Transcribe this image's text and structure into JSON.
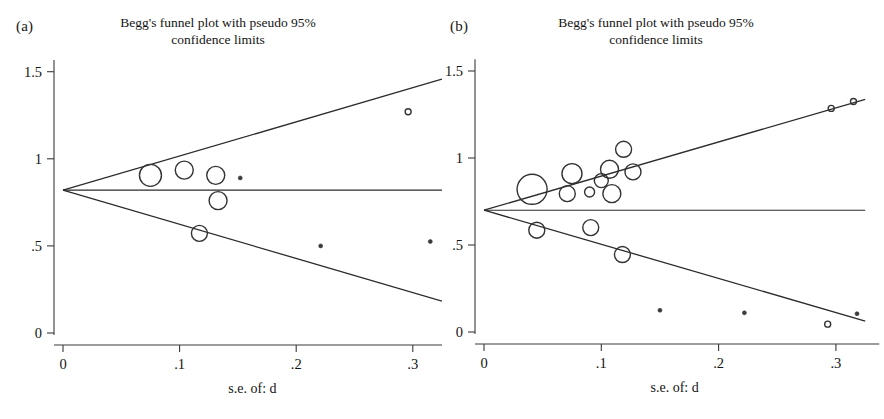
{
  "figure": {
    "background": "#ffffff",
    "stroke_color": "#2b2b2b",
    "text_color": "#141414"
  },
  "panels": [
    {
      "letter": "(a)",
      "title_line1": "Begg's funnel plot with pseudo 95%",
      "title_line2": "confidence limits"
    },
    {
      "letter": "(b)",
      "title_line1": "Begg's funnel plot with pseudo 95%",
      "title_line2": "confidence limits"
    }
  ],
  "axis": {
    "xlabel": "s.e. of: d",
    "x_ticks": [
      "0",
      ".1",
      ".2",
      ".3"
    ],
    "y_ticks": [
      "0",
      ".5",
      "1",
      "1.5"
    ]
  },
  "chart_data": [
    {
      "type": "scatter",
      "panel": "(a)",
      "title": "Begg's funnel plot with pseudo 95% confidence limits",
      "xlabel": "s.e. of: d",
      "ylabel": "d",
      "xlim": [
        0,
        0.325
      ],
      "ylim": [
        -0.05,
        1.55
      ],
      "x_ticks": [
        0,
        0.1,
        0.2,
        0.3
      ],
      "x_tick_labels": [
        "0",
        ".1",
        ".2",
        ".3"
      ],
      "y_ticks": [
        0,
        0.5,
        1,
        1.5
      ],
      "y_tick_labels": [
        "0",
        ".5",
        "1",
        "1.5"
      ],
      "grid": false,
      "legend": "none",
      "pooled_effect": 0.82,
      "pseudo_ci_slope": 1.96,
      "reference_line": {
        "type": "horizontal",
        "y": 0.82
      },
      "ci_upper_endpoint": {
        "x": 0.325,
        "y": 1.457
      },
      "ci_lower_endpoint": {
        "x": 0.325,
        "y": 0.183
      },
      "points": [
        {
          "se": 0.075,
          "d": 0.905,
          "marker_r": 11,
          "style": "open"
        },
        {
          "se": 0.104,
          "d": 0.935,
          "marker_r": 9,
          "style": "open"
        },
        {
          "se": 0.131,
          "d": 0.905,
          "marker_r": 9,
          "style": "open"
        },
        {
          "se": 0.152,
          "d": 0.89,
          "marker_r": 2,
          "style": "filled"
        },
        {
          "se": 0.133,
          "d": 0.76,
          "marker_r": 9,
          "style": "open"
        },
        {
          "se": 0.117,
          "d": 0.572,
          "marker_r": 8,
          "style": "open"
        },
        {
          "se": 0.296,
          "d": 1.27,
          "marker_r": 3,
          "style": "open"
        },
        {
          "se": 0.221,
          "d": 0.5,
          "marker_r": 2,
          "style": "filled"
        },
        {
          "se": 0.315,
          "d": 0.525,
          "marker_r": 2,
          "style": "filled"
        }
      ]
    },
    {
      "type": "scatter",
      "panel": "(b)",
      "title": "Begg's funnel plot with pseudo 95% confidence limits",
      "xlabel": "s.e. of: d",
      "ylabel": "d",
      "xlim": [
        0,
        0.325
      ],
      "ylim": [
        -0.05,
        1.55
      ],
      "x_ticks": [
        0,
        0.1,
        0.2,
        0.3
      ],
      "x_tick_labels": [
        "0",
        ".1",
        ".2",
        ".3"
      ],
      "y_ticks": [
        0,
        0.5,
        1,
        1.5
      ],
      "y_tick_labels": [
        "0",
        ".5",
        "1",
        "1.5"
      ],
      "grid": false,
      "legend": "none",
      "pooled_effect": 0.7,
      "pseudo_ci_slope": 1.96,
      "reference_line": {
        "type": "horizontal",
        "y": 0.7
      },
      "ci_upper_endpoint": {
        "x": 0.325,
        "y": 1.337
      },
      "ci_lower_endpoint": {
        "x": 0.325,
        "y": 0.063
      },
      "points": [
        {
          "se": 0.041,
          "d": 0.82,
          "marker_r": 15,
          "style": "open"
        },
        {
          "se": 0.075,
          "d": 0.91,
          "marker_r": 10,
          "style": "open"
        },
        {
          "se": 0.071,
          "d": 0.795,
          "marker_r": 8,
          "style": "open"
        },
        {
          "se": 0.09,
          "d": 0.805,
          "marker_r": 5,
          "style": "open"
        },
        {
          "se": 0.119,
          "d": 1.05,
          "marker_r": 8,
          "style": "open"
        },
        {
          "se": 0.107,
          "d": 0.935,
          "marker_r": 9,
          "style": "open"
        },
        {
          "se": 0.127,
          "d": 0.92,
          "marker_r": 8,
          "style": "open"
        },
        {
          "se": 0.1,
          "d": 0.87,
          "marker_r": 7,
          "style": "open"
        },
        {
          "se": 0.109,
          "d": 0.795,
          "marker_r": 9,
          "style": "open"
        },
        {
          "se": 0.045,
          "d": 0.585,
          "marker_r": 8,
          "style": "open"
        },
        {
          "se": 0.091,
          "d": 0.6,
          "marker_r": 8,
          "style": "open"
        },
        {
          "se": 0.118,
          "d": 0.445,
          "marker_r": 8,
          "style": "open"
        },
        {
          "se": 0.15,
          "d": 0.125,
          "marker_r": 2,
          "style": "filled"
        },
        {
          "se": 0.222,
          "d": 0.11,
          "marker_r": 2,
          "style": "filled"
        },
        {
          "se": 0.293,
          "d": 0.045,
          "marker_r": 3,
          "style": "open"
        },
        {
          "se": 0.318,
          "d": 0.105,
          "marker_r": 2,
          "style": "filled"
        },
        {
          "se": 0.296,
          "d": 1.285,
          "marker_r": 3,
          "style": "open"
        },
        {
          "se": 0.315,
          "d": 1.325,
          "marker_r": 3,
          "style": "open"
        }
      ]
    }
  ]
}
